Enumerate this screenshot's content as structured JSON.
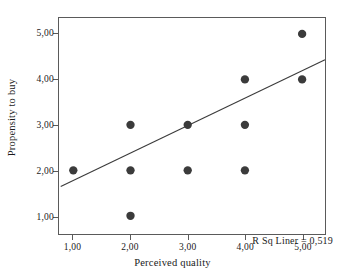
{
  "chart_data": {
    "type": "scatter",
    "title": "",
    "xlabel": "Perceived quality",
    "ylabel": "Propensity to buy",
    "xlim": [
      0.75,
      5.4
    ],
    "ylim": [
      0.6,
      5.35
    ],
    "grid": false,
    "legend": null,
    "x_ticks": [
      "1,00",
      "2,00",
      "3,00",
      "4,00",
      "5,00"
    ],
    "x_tick_values": [
      1,
      2,
      3,
      4,
      5
    ],
    "y_ticks": [
      "1,00",
      "2,00",
      "3,00",
      "4,00",
      "5,00"
    ],
    "y_tick_values": [
      1,
      2,
      3,
      4,
      5
    ],
    "points": [
      {
        "x": 1,
        "y": 2
      },
      {
        "x": 2,
        "y": 1
      },
      {
        "x": 2,
        "y": 2
      },
      {
        "x": 2,
        "y": 3
      },
      {
        "x": 3,
        "y": 2
      },
      {
        "x": 3,
        "y": 3
      },
      {
        "x": 4,
        "y": 2
      },
      {
        "x": 4,
        "y": 3
      },
      {
        "x": 4,
        "y": 4
      },
      {
        "x": 5,
        "y": 4
      },
      {
        "x": 5,
        "y": 5
      }
    ],
    "marker": {
      "shape": "circle",
      "color": "#3b3b3b",
      "size": 4.2
    },
    "fit_line": {
      "type": "linear",
      "color": "#3b3b3b",
      "x_start": 0.78,
      "y_start": 1.645,
      "x_end": 5.4,
      "y_end": 4.43
    },
    "annotation": "R Sq Liner = 0,519",
    "r_squared": 0.519,
    "colors": {
      "marker": "#3b3b3b",
      "line": "#3b3b3b",
      "frame": "#5a5a5a",
      "text": "#1a1a1a",
      "background": "#ffffff"
    }
  }
}
